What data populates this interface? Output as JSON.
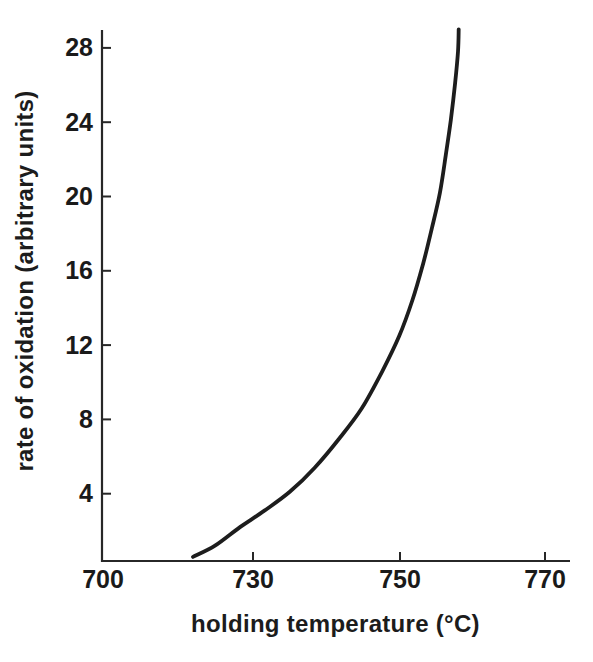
{
  "figure": {
    "background": "#ffffff"
  },
  "chart_data": {
    "type": "line",
    "title": "",
    "xlabel": "holding temperature (°C)",
    "ylabel": "rate of oxidation (arbitrary units)",
    "x_ticks": [
      700,
      730,
      750,
      770
    ],
    "y_ticks": [
      4,
      8,
      12,
      16,
      20,
      24,
      28
    ],
    "x_range": [
      700,
      773
    ],
    "y_range": [
      0,
      29.5
    ],
    "grid": false,
    "legend": "none",
    "colors": {
      "line": "#1d1d1d",
      "axis": "#272727",
      "text": "#1a1a1a",
      "background": "#ffffff"
    },
    "series": [
      {
        "name": "rate of oxidation vs holding temperature",
        "points": [
          [
            718.0,
            0.6
          ],
          [
            722.4,
            1.2
          ],
          [
            727.4,
            2.2
          ],
          [
            731.6,
            3.1
          ],
          [
            735.0,
            4.1
          ],
          [
            738.4,
            5.4
          ],
          [
            741.8,
            7.0
          ],
          [
            744.8,
            8.6
          ],
          [
            747.6,
            10.6
          ],
          [
            749.9,
            12.5
          ],
          [
            751.7,
            14.4
          ],
          [
            753.2,
            16.4
          ],
          [
            754.4,
            18.3
          ],
          [
            755.5,
            20.2
          ],
          [
            756.3,
            22.2
          ],
          [
            757.0,
            24.1
          ],
          [
            757.6,
            26.1
          ],
          [
            758.0,
            27.8
          ],
          [
            758.1,
            29.0
          ]
        ]
      }
    ]
  }
}
